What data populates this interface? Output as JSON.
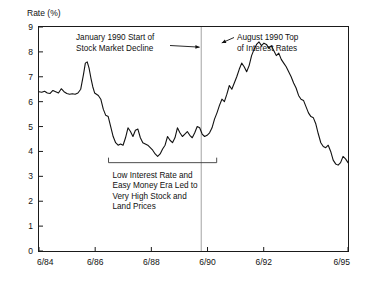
{
  "chart_data": {
    "type": "line",
    "title": "",
    "ylabel": "Rate (%)",
    "xlabel": "",
    "ylim": [
      0,
      9
    ],
    "xlim": [
      "6/84",
      "6/95"
    ],
    "grid": false,
    "legend": "none",
    "y_ticks": [
      "0",
      "1",
      "2",
      "3",
      "4",
      "5",
      "6",
      "7",
      "8",
      "9"
    ],
    "x_ticks": [
      "6/84",
      "6/86",
      "6/88",
      "6/90",
      "6/92",
      "6/95"
    ],
    "x_tick_positions": [
      0.0,
      0.1818,
      0.3636,
      0.5454,
      0.7272,
      1.0
    ],
    "series": [
      {
        "name": "Interest Rate",
        "color": "#111111",
        "x": [
          0.0,
          0.009,
          0.018,
          0.027,
          0.036,
          0.045,
          0.054,
          0.063,
          0.072,
          0.081,
          0.09,
          0.099,
          0.108,
          0.117,
          0.126,
          0.135,
          0.144,
          0.15,
          0.156,
          0.162,
          0.168,
          0.174,
          0.18,
          0.186,
          0.192,
          0.2,
          0.208,
          0.216,
          0.224,
          0.232,
          0.24,
          0.248,
          0.256,
          0.264,
          0.272,
          0.28,
          0.288,
          0.296,
          0.304,
          0.312,
          0.32,
          0.328,
          0.336,
          0.344,
          0.352,
          0.36,
          0.368,
          0.376,
          0.384,
          0.392,
          0.4,
          0.408,
          0.416,
          0.424,
          0.432,
          0.44,
          0.448,
          0.456,
          0.464,
          0.472,
          0.48,
          0.488,
          0.496,
          0.504,
          0.512,
          0.52,
          0.528,
          0.536,
          0.544,
          0.552,
          0.56,
          0.568,
          0.576,
          0.584,
          0.592,
          0.6,
          0.608,
          0.616,
          0.624,
          0.632,
          0.64,
          0.648,
          0.656,
          0.664,
          0.672,
          0.68,
          0.688,
          0.696,
          0.704,
          0.712,
          0.72,
          0.728,
          0.736,
          0.744,
          0.752,
          0.76,
          0.768,
          0.776,
          0.784,
          0.792,
          0.8,
          0.808,
          0.816,
          0.824,
          0.832,
          0.84,
          0.848,
          0.856,
          0.864,
          0.872,
          0.88,
          0.888,
          0.896,
          0.904,
          0.912,
          0.92,
          0.928,
          0.936,
          0.944,
          0.952,
          0.96,
          0.968,
          0.976,
          0.984,
          0.992,
          1.0
        ],
        "y": [
          6.4,
          6.38,
          6.42,
          6.35,
          6.33,
          6.45,
          6.4,
          6.35,
          6.52,
          6.4,
          6.33,
          6.3,
          6.32,
          6.3,
          6.35,
          6.5,
          7.1,
          7.55,
          7.6,
          7.35,
          6.95,
          6.6,
          6.35,
          6.3,
          6.25,
          6.1,
          5.7,
          5.45,
          5.4,
          5.0,
          4.6,
          4.35,
          4.25,
          4.3,
          4.25,
          4.55,
          4.95,
          4.8,
          4.6,
          4.85,
          4.9,
          4.55,
          4.35,
          4.3,
          4.25,
          4.15,
          4.05,
          3.9,
          3.8,
          3.9,
          4.1,
          4.25,
          4.6,
          4.45,
          4.35,
          4.55,
          4.95,
          4.75,
          4.6,
          4.7,
          4.8,
          4.65,
          4.55,
          4.75,
          5.0,
          4.95,
          4.7,
          4.6,
          4.65,
          4.75,
          4.95,
          5.3,
          5.55,
          5.85,
          6.1,
          6.0,
          6.3,
          6.65,
          6.5,
          6.75,
          7.0,
          7.3,
          7.55,
          7.4,
          7.2,
          7.45,
          7.85,
          8.1,
          8.3,
          8.4,
          8.25,
          8.35,
          8.3,
          8.15,
          8.25,
          8.05,
          7.85,
          7.95,
          7.7,
          7.55,
          7.4,
          7.2,
          7.0,
          6.75,
          6.55,
          6.25,
          6.1,
          6.05,
          5.8,
          5.55,
          5.4,
          5.35,
          5.1,
          4.7,
          4.35,
          4.2,
          4.15,
          4.25,
          4.0,
          3.65,
          3.5,
          3.45,
          3.55,
          3.8,
          3.7,
          3.55
        ]
      }
    ],
    "annotations": [
      {
        "name": "january-1990-annotation",
        "lines": [
          "January 1990 Start of",
          "Stock Market Decline"
        ],
        "target_x": 0.523,
        "target_y": 8.15
      },
      {
        "name": "august-1990-annotation",
        "lines": [
          "August 1990 Top",
          "of Interest Rates"
        ],
        "target_x": 0.585,
        "target_y": 8.42
      },
      {
        "name": "low-rate-era-bracket-annotation",
        "lines": [
          "Low Interest Rate and",
          "Easy Money Era Led to",
          "Very High Stock and",
          "Land Prices"
        ],
        "bracket_from_x": 0.225,
        "bracket_to_x": 0.575,
        "bracket_y": 3.55
      }
    ],
    "vertical_marker": {
      "name": "january-1990-marker",
      "x": 0.525
    }
  }
}
